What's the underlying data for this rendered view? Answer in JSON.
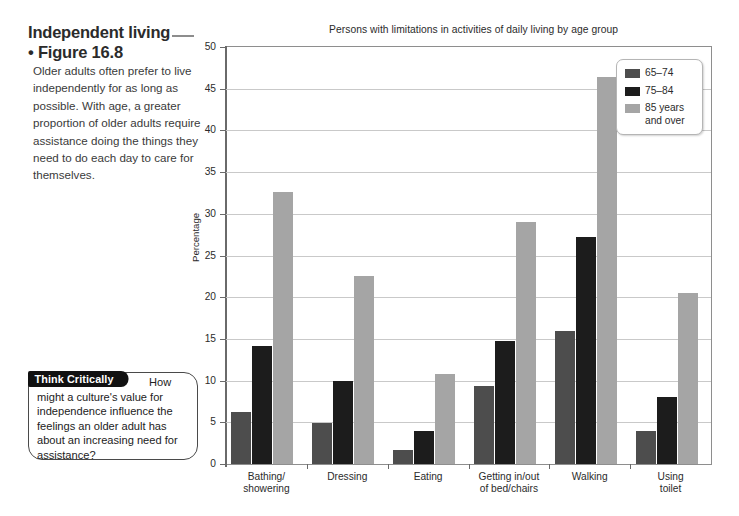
{
  "figure": {
    "heading_line1": "Independent living",
    "heading_line2": "• Figure 16.8",
    "caption": "Older adults often prefer to live independently for as long as possible. With age, a greater proportion of older adults require assistance doing the things they need to do each day to care for themselves."
  },
  "think_critically": {
    "badge": "Think Critically",
    "question": "How might a culture's value for independence influence the feelings an older adult has about an increasing need for assistance?"
  },
  "chart_data": {
    "type": "bar",
    "title": "Persons with limitations in activities of daily living by age group",
    "xlabel": "",
    "ylabel": "Percentage",
    "ylim": [
      0,
      50
    ],
    "ytick_labels": [
      "0",
      "5",
      "10",
      "15",
      "20",
      "25",
      "30",
      "35",
      "40",
      "45",
      "50"
    ],
    "yticks": [
      0,
      5,
      10,
      15,
      20,
      25,
      30,
      35,
      40,
      45,
      50
    ],
    "grid": "horizontal",
    "legend_position": "top-right",
    "categories": [
      "Bathing/\nshowering",
      "Dressing",
      "Eating",
      "Getting in/out\nof bed/chairs",
      "Walking",
      "Using\ntoilet"
    ],
    "series": [
      {
        "name": "65–74",
        "color": "#4d4d4d",
        "values": [
          6.2,
          4.9,
          1.7,
          9.4,
          16.0,
          4.0
        ]
      },
      {
        "name": "75–84",
        "color": "#1c1c1c",
        "values": [
          14.2,
          9.9,
          3.9,
          14.8,
          27.2,
          8.0
        ]
      },
      {
        "name": "85 years\nand over",
        "color": "#a5a5a5",
        "values": [
          32.6,
          22.5,
          10.8,
          29.0,
          46.4,
          20.5
        ]
      }
    ]
  },
  "colors": {
    "series_65_74": "#4d4d4d",
    "series_75_84": "#1c1c1c",
    "series_85_plus": "#a5a5a5",
    "gridline": "#c9c9c9",
    "axis": "#6a6a6a",
    "frame": "#8e8e8e"
  }
}
